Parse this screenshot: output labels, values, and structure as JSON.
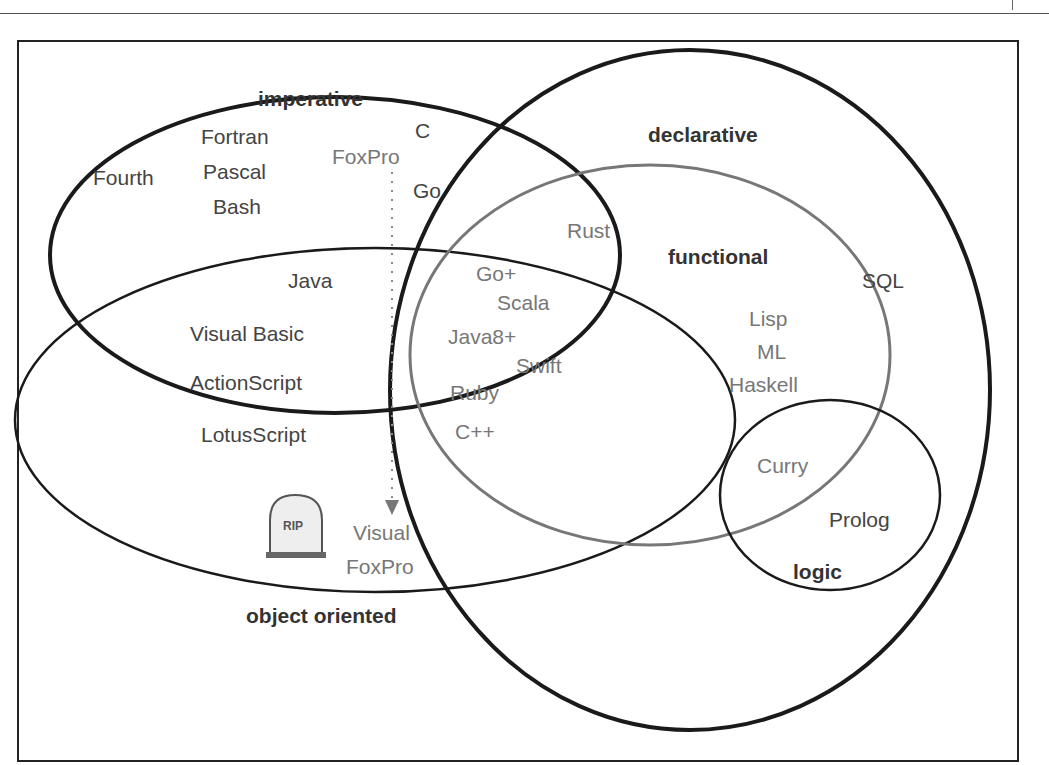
{
  "diagram": {
    "sets": {
      "imperative": "imperative",
      "declarative": "declarative",
      "functional": "functional",
      "object_oriented": "object oriented",
      "logic": "logic"
    },
    "languages": {
      "fourth": "Fourth",
      "fortran": "Fortran",
      "pascal": "Pascal",
      "bash": "Bash",
      "c": "C",
      "foxpro": "FoxPro",
      "go": "Go",
      "rust": "Rust",
      "java": "Java",
      "visual_basic": "Visual Basic",
      "actionscript": "ActionScript",
      "lotusscript": "LotusScript",
      "go_plus": "Go+",
      "scala": "Scala",
      "java8_plus": "Java8+",
      "swift": "Swift",
      "ruby": "Ruby",
      "cpp": "C++",
      "sql": "SQL",
      "lisp": "Lisp",
      "ml": "ML",
      "haskell": "Haskell",
      "curry": "Curry",
      "prolog": "Prolog",
      "visual": "Visual",
      "foxpro2": "FoxPro"
    },
    "tombstone_text": "RIP"
  }
}
